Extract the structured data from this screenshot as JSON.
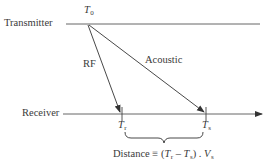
{
  "diagram": {
    "transmitter_label": "Transmitter",
    "receiver_label": "Receiver",
    "t0": {
      "main": "T",
      "sub": "0"
    },
    "rf_label": "RF",
    "acoustic_label": "Acoustic",
    "tr": {
      "main": "T",
      "sub": "r"
    },
    "ts": {
      "main": "T",
      "sub": "s"
    },
    "formula": {
      "prefix": "Distance ≡ (",
      "t1": "T",
      "t1_sub": "r",
      "minus": " – ",
      "t2": "T",
      "t2_sub": "s",
      "close": ") . ",
      "v": "V",
      "v_sub": "s"
    },
    "colors": {
      "line": "#3a3a3a",
      "background": "#ffffff"
    }
  }
}
